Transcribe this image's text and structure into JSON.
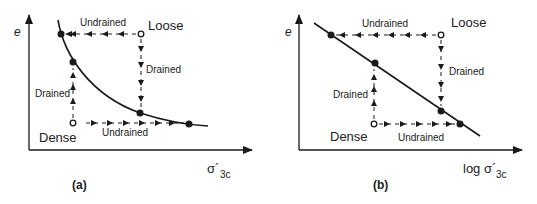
{
  "figure": {
    "panels": [
      {
        "id": "a",
        "caption": "(a)",
        "y_axis_label": "e",
        "x_axis_label": "σ´",
        "x_axis_subscript": "3c",
        "curve_type": "curved",
        "state_labels": {
          "loose": "Loose",
          "dense": "Dense"
        },
        "path_labels": {
          "top_undrained": "Undrained",
          "right_drained": "Drained",
          "left_drained": "Drained",
          "bottom_undrained": "Undrained"
        }
      },
      {
        "id": "b",
        "caption": "(b)",
        "y_axis_label": "e",
        "x_axis_label": "log σ´",
        "x_axis_subscript": "3c",
        "curve_type": "straight",
        "state_labels": {
          "loose": "Loose",
          "dense": "Dense"
        },
        "path_labels": {
          "top_undrained": "Undrained",
          "right_drained": "Drained",
          "left_drained": "Drained",
          "bottom_undrained": "Undrained"
        }
      }
    ],
    "colors": {
      "ink": "#1a1a1a",
      "background": "#ffffff"
    }
  }
}
